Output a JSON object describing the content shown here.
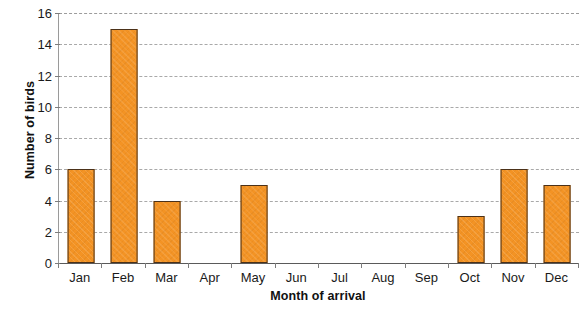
{
  "chart_data": {
    "type": "bar",
    "title": "",
    "xlabel": "Month of arrival",
    "ylabel": "Number of birds",
    "categories": [
      "Jan",
      "Feb",
      "Mar",
      "Apr",
      "May",
      "Jun",
      "Jul",
      "Aug",
      "Sep",
      "Oct",
      "Nov",
      "Dec"
    ],
    "values": [
      6,
      15,
      4,
      0,
      5,
      0,
      0,
      0,
      0,
      3,
      6,
      5
    ],
    "ylim": [
      0,
      16
    ],
    "ytick_values": [
      0,
      2,
      4,
      6,
      8,
      10,
      12,
      14,
      16
    ],
    "ytick_labels": [
      "0",
      "2",
      "4",
      "6",
      "8",
      "10",
      "12",
      "14",
      "16"
    ],
    "grid": "horizontal-dashed",
    "legend": "none",
    "bar_fill_color": "#f39324",
    "bar_border_color": "#4b3119",
    "gridline_color": "#a9a9a9",
    "axis_color": "#5a5a5a",
    "background_color": "#ffffff"
  }
}
